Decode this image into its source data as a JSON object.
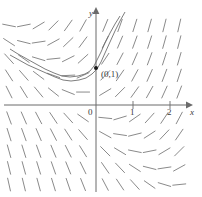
{
  "figure": {
    "kind": "slope-field-plot",
    "colors": {
      "axis": "#6b6b6b",
      "slope_mark": "#8a8a8a",
      "curve": "#6e6e6e",
      "point": "#1a1a1a",
      "text": "#3a3a3a",
      "background": "#ffffff"
    },
    "axes": {
      "x_label": "x",
      "y_label": "y",
      "origin_label": "0",
      "x_ticks": [
        {
          "value": 1,
          "label": "1"
        },
        {
          "value": 2,
          "label": "2"
        }
      ]
    },
    "annotations": [
      {
        "name": "initial-condition",
        "label": "(0,1)",
        "x": 0,
        "y": 1
      }
    ]
  },
  "chart_data": {
    "type": "scatter",
    "title": "",
    "xlabel": "x",
    "ylabel": "y",
    "xlim": [
      -2.6,
      2.9
    ],
    "ylim": [
      -2.5,
      2.4
    ],
    "grid": false,
    "legend": null,
    "xticks": [
      1,
      2
    ],
    "xticklabels": [
      "1",
      "2"
    ],
    "yticks": [],
    "yticklabels": [],
    "pixel_geometry": {
      "origin_px": [
        96,
        105
      ],
      "unit_px_x": 37,
      "unit_px_y": 37,
      "width_px": 202,
      "height_px": 197
    },
    "slope_field": {
      "description": "Short line segments with slope dy/dx = x + y drawn on a rectangular lattice",
      "formula": "dy/dx = x + y",
      "segment_length_px": 13,
      "x_values": [
        -2.35,
        -1.95,
        -1.55,
        -1.15,
        -0.75,
        -0.35,
        0.25,
        0.65,
        1.05,
        1.45,
        1.85,
        2.25
      ],
      "y_values": [
        2.15,
        1.7,
        1.25,
        0.8,
        0.35,
        -0.35,
        -0.8,
        -1.25,
        -1.7,
        -2.15
      ]
    },
    "annotations": [
      {
        "text": "(0,1)",
        "x": 0,
        "y": 1,
        "marker": "dot"
      }
    ],
    "series": [
      {
        "name": "solution-curve-through-0-1",
        "type": "line",
        "points_px": [
          [
            10,
            49
          ],
          [
            18,
            54
          ],
          [
            27,
            59
          ],
          [
            36,
            64
          ],
          [
            45,
            69
          ],
          [
            54,
            73
          ],
          [
            62,
            76
          ],
          [
            70,
            77
          ],
          [
            78,
            76
          ],
          [
            85,
            74
          ],
          [
            90,
            71
          ],
          [
            94,
            66
          ],
          [
            97,
            60
          ],
          [
            101,
            52
          ],
          [
            105,
            43
          ],
          [
            110,
            33
          ],
          [
            115,
            24
          ],
          [
            120,
            16
          ]
        ]
      },
      {
        "name": "solution-curve-secondary",
        "type": "line",
        "points_px": [
          [
            10,
            55
          ],
          [
            19,
            60
          ],
          [
            28,
            65
          ],
          [
            37,
            69
          ],
          [
            46,
            73
          ],
          [
            55,
            77
          ],
          [
            63,
            80
          ],
          [
            71,
            81
          ],
          [
            79,
            80
          ],
          [
            86,
            78
          ],
          [
            92,
            74
          ],
          [
            97,
            69
          ],
          [
            101,
            62
          ],
          [
            105,
            53
          ],
          [
            110,
            42
          ],
          [
            115,
            31
          ],
          [
            120,
            21
          ],
          [
            125,
            12
          ]
        ]
      }
    ]
  }
}
